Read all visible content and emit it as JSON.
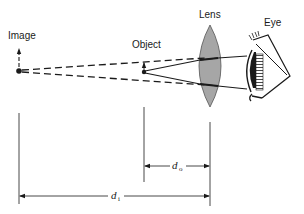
{
  "diagram": {
    "type": "optics-magnifier-ray-diagram",
    "labels": {
      "image": "Image",
      "object": "Object",
      "lens": "Lens",
      "eye": "Eye",
      "d_o_symbol": "d",
      "d_o_subscript": "o",
      "d_i_symbol": "d",
      "d_i_subscript": "i"
    },
    "colors": {
      "ink": "#1a1a1a",
      "lens_fill": "#a6a6a6",
      "background": "#ffffff"
    },
    "elements": [
      {
        "id": "image-point",
        "kind": "point-with-arrow",
        "label": "Image"
      },
      {
        "id": "object-point",
        "kind": "point-with-arrow",
        "label": "Object"
      },
      {
        "id": "lens",
        "kind": "converging-lens",
        "label": "Lens"
      },
      {
        "id": "eye",
        "kind": "eye",
        "label": "Eye"
      },
      {
        "id": "virtual-rays",
        "kind": "dashed-lines",
        "from": "image-point",
        "to": "lens"
      },
      {
        "id": "real-rays",
        "kind": "solid-lines",
        "from": "object-point",
        "to": "eye"
      },
      {
        "id": "object-distance",
        "kind": "dimension",
        "label": "d_o",
        "from": "object-point",
        "to": "lens"
      },
      {
        "id": "image-distance",
        "kind": "dimension",
        "label": "d_i",
        "from": "image-point",
        "to": "lens"
      }
    ]
  }
}
